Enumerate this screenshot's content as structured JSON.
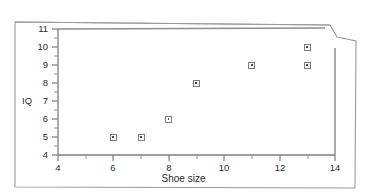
{
  "figure": {
    "type": "scatter-plot-figure",
    "background_color": "#ffffff",
    "line_color": "#7d7d7d",
    "text_color": "#2b2b2b",
    "marker_color": "#7d7d7d",
    "document_border_color": "#9a9a9a"
  },
  "chart_data": {
    "type": "scatter",
    "title": "",
    "xlabel": "Shoe size",
    "ylabel": "IQ",
    "xlim": [
      4,
      14
    ],
    "ylim": [
      4,
      11
    ],
    "x": [
      6,
      7,
      8,
      9,
      11,
      13,
      13
    ],
    "y": [
      5,
      5,
      6,
      8,
      9,
      10,
      9
    ],
    "points": [
      {
        "x": 6,
        "y": 5
      },
      {
        "x": 7,
        "y": 5
      },
      {
        "x": 8,
        "y": 6
      },
      {
        "x": 9,
        "y": 8
      },
      {
        "x": 11,
        "y": 9
      },
      {
        "x": 13,
        "y": 10
      },
      {
        "x": 13,
        "y": 9
      }
    ],
    "xticks": [
      4,
      6,
      8,
      10,
      12,
      14
    ],
    "xtick_labels": [
      "4",
      "6",
      "8",
      "10",
      "12",
      "14"
    ],
    "x_minor_tick_step": 1,
    "yticks": [
      4,
      5,
      6,
      7,
      8,
      9,
      10,
      11
    ],
    "ytick_labels": [
      "4",
      "5",
      "6",
      "7",
      "8",
      "9",
      "10",
      "11"
    ],
    "y_minor_tick_step": 0.5,
    "grid": false,
    "legend": null,
    "legend_position": "none",
    "marker_style": "open-square-with-center-dot",
    "annotations": []
  },
  "labels": {
    "y_axis_title": "IQ",
    "x_axis_title": "Shoe size",
    "y_tick_11": "11",
    "y_tick_10": "10",
    "y_tick_9": "9",
    "y_tick_8": "8",
    "y_tick_7": "7",
    "y_tick_6": "6",
    "y_tick_5": "5",
    "y_tick_4": "4",
    "x_tick_4": "4",
    "x_tick_6": "6",
    "x_tick_8": "8",
    "x_tick_10": "10",
    "x_tick_12": "12",
    "x_tick_14": "14"
  }
}
